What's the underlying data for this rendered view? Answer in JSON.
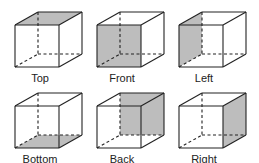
{
  "diagram": {
    "colors": {
      "edge": "#222222",
      "shade": "#bdbdbd",
      "background": "#ffffff"
    },
    "cubes": [
      {
        "label": "Top",
        "shaded_face": "top"
      },
      {
        "label": "Front",
        "shaded_face": "front"
      },
      {
        "label": "Left",
        "shaded_face": "left"
      },
      {
        "label": "Bottom",
        "shaded_face": "bottom"
      },
      {
        "label": "Back",
        "shaded_face": "back"
      },
      {
        "label": "Right",
        "shaded_face": "right"
      }
    ]
  }
}
